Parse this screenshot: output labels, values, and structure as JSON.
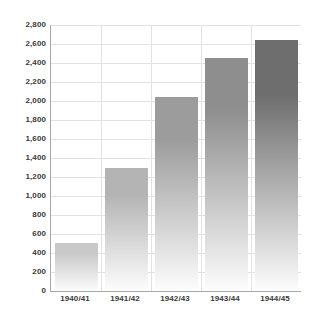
{
  "chart_data": {
    "type": "bar",
    "title": "",
    "subtitle": "",
    "xlabel": "",
    "ylabel": "",
    "categories": [
      "1940/41",
      "1941/42",
      "1942/43",
      "1943/44",
      "1944/45"
    ],
    "values": [
      505,
      1300,
      2040,
      2450,
      2640
    ],
    "series": [
      {
        "name": "",
        "values": [
          505,
          1300,
          2040,
          2450,
          2640
        ]
      }
    ],
    "ylim": [
      0,
      2800
    ],
    "ytick_step": 200,
    "ytick_labels": [
      "0",
      "200",
      "400",
      "600",
      "800",
      "1,000",
      "1,200",
      "1,400",
      "1,600",
      "1,800",
      "2,000",
      "2,200",
      "2,400",
      "2,600",
      "2,800"
    ],
    "ytick_values": [
      0,
      200,
      400,
      600,
      800,
      1000,
      1200,
      1400,
      1600,
      1800,
      2000,
      2200,
      2400,
      2600,
      2800
    ],
    "grid": true,
    "grid_horizontal": true,
    "grid_vertical": true,
    "legend": false,
    "legend_position": "none",
    "bar_top_colors": [
      "#c9c9c9",
      "#b4b4b4",
      "#9c9c9c",
      "#8e8e8e",
      "#6e6e6e"
    ],
    "bar_bottom_color": "#fdfdfd",
    "axis_color": "#a8a8a8",
    "grid_color": "#e2e2e2",
    "text_color": "#3a3a3a",
    "background_color": "#ffffff"
  }
}
